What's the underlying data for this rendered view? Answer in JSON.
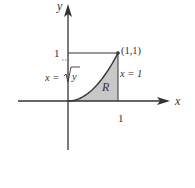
{
  "figure": {
    "axes": {
      "x_label": "x",
      "y_label": "y",
      "x_tick_label": "1",
      "y_tick_label": "1"
    },
    "curve": {
      "label_lhs": "x = ",
      "label_radicand": "y",
      "equation": "x = √y",
      "domain": [
        0,
        1
      ]
    },
    "vertical_line": {
      "label": "x = 1",
      "x": 1
    },
    "point": {
      "label": "(1,1)",
      "x": 1,
      "y": 1
    },
    "region": {
      "label": "R",
      "fill_color": "#c8c8c8",
      "description": "region bounded by x = √y, x = 1 and the x-axis"
    },
    "colors": {
      "ink": "#333333",
      "shade": "#c8c8c8"
    }
  }
}
